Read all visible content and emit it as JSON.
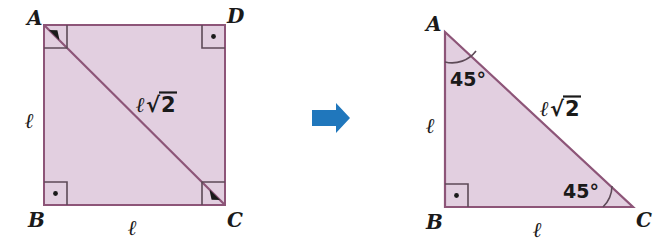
{
  "figure": {
    "colors": {
      "fill": "#e2cfe0",
      "stroke": "#8d5578",
      "arrow": "#2077bc",
      "text": "#1a1a1a",
      "background": "#ffffff"
    }
  },
  "square": {
    "name": "square-abcd",
    "vertices": {
      "a": "A",
      "b": "B",
      "c": "C",
      "d": "D"
    },
    "side_label_left": "ℓ",
    "side_label_bottom": "ℓ",
    "diagonal": {
      "symbol": "ℓ",
      "radical": "√",
      "radicand": "2",
      "full": "ℓ√2"
    },
    "right_angle_markers": 4
  },
  "arrow": {
    "name": "transform-arrow",
    "direction": "right",
    "color": "#2077bc"
  },
  "triangle": {
    "name": "triangle-abc",
    "vertices": {
      "a": "A",
      "b": "B",
      "c": "C"
    },
    "leg_label_vertical": "ℓ",
    "leg_label_horizontal": "ℓ",
    "hypotenuse": {
      "symbol": "ℓ",
      "radical": "√",
      "radicand": "2",
      "full": "ℓ√2"
    },
    "angles": {
      "at_a": "45°",
      "at_c": "45°",
      "at_b_right_angle": true
    },
    "right_angle_markers": 1
  }
}
